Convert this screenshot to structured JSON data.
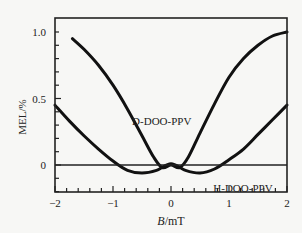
{
  "chart_data": {
    "type": "line",
    "title": "",
    "xlabel": "B/mT",
    "ylabel": "MEL/%",
    "xlim": [
      -2,
      2
    ],
    "ylim": [
      -0.2,
      1.1
    ],
    "xticks": [
      "-2",
      "-1",
      "0",
      "1",
      "2"
    ],
    "yticks": [
      "0",
      "0.5",
      "1.0"
    ],
    "grid": false,
    "legend": "none (inline curve labels)",
    "series": [
      {
        "name": "D-DOO-PPV",
        "x": [
          -1.7,
          -1.5,
          -1.25,
          -1.0,
          -0.75,
          -0.5,
          -0.3,
          -0.15,
          0.0,
          0.15,
          0.3,
          0.5,
          0.75,
          1.0,
          1.25,
          1.5,
          1.75,
          2.0
        ],
        "y": [
          0.95,
          0.87,
          0.75,
          0.6,
          0.42,
          0.22,
          0.06,
          -0.02,
          0.0,
          -0.02,
          0.06,
          0.24,
          0.46,
          0.66,
          0.8,
          0.9,
          0.97,
          1.0
        ]
      },
      {
        "name": "H-DOO-PPV",
        "x": [
          -2.0,
          -1.75,
          -1.5,
          -1.25,
          -1.0,
          -0.75,
          -0.5,
          -0.25,
          0.0,
          0.25,
          0.5,
          0.75,
          1.0,
          1.25,
          1.5,
          1.75,
          2.0
        ],
        "y": [
          0.45,
          0.33,
          0.22,
          0.12,
          0.03,
          -0.04,
          -0.06,
          -0.04,
          0.01,
          -0.04,
          -0.06,
          -0.03,
          0.04,
          0.12,
          0.23,
          0.34,
          0.45
        ]
      }
    ],
    "annotations": [
      {
        "text": "D-DOO-PPV",
        "x": -0.05,
        "y": 0.3
      },
      {
        "text": "H-DOO-PPV",
        "x": 1.35,
        "y": -0.1
      }
    ],
    "reference_lines": [
      {
        "axis": "y",
        "value": 0
      }
    ]
  }
}
